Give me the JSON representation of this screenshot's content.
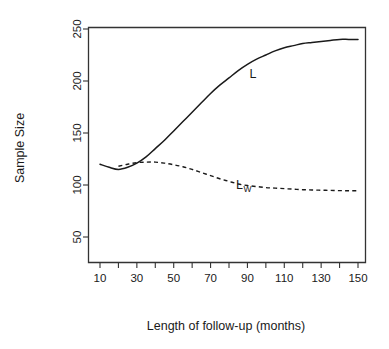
{
  "chart_data": {
    "type": "line",
    "title": "",
    "xlabel": "Length of follow-up (months)",
    "ylabel": "Sample Size",
    "xlim": [
      10,
      150
    ],
    "ylim": [
      40,
      258
    ],
    "grid": false,
    "legend_position": "inline-annotation",
    "x_ticks": [
      10,
      20,
      30,
      40,
      50,
      60,
      70,
      80,
      90,
      100,
      110,
      120,
      130,
      140,
      150
    ],
    "x_ticklabels": [
      "10",
      "",
      "30",
      "",
      "50",
      "",
      "70",
      "",
      "90",
      "",
      "110",
      "",
      "130",
      "",
      "150"
    ],
    "y_ticks": [
      50,
      100,
      150,
      200,
      250
    ],
    "y_ticklabels": [
      "50",
      "100",
      "150",
      "200",
      "250"
    ],
    "series": [
      {
        "name": "L",
        "style": "solid",
        "annotation": "L",
        "annotation_x": 93,
        "annotation_y": 203,
        "x": [
          10,
          15,
          20,
          25,
          30,
          35,
          40,
          45,
          50,
          55,
          60,
          65,
          70,
          75,
          80,
          85,
          90,
          95,
          100,
          105,
          110,
          115,
          120,
          125,
          130,
          135,
          140,
          145,
          150
        ],
        "values": [
          120,
          117,
          115,
          117,
          121,
          127,
          135,
          143,
          152,
          161,
          170,
          179,
          188,
          196,
          203,
          210,
          216,
          221,
          225,
          229,
          232,
          234,
          236,
          237,
          238,
          239,
          240,
          240,
          240
        ]
      },
      {
        "name": "Lw",
        "style": "dashed",
        "annotation": "L",
        "annotation_sub": "W",
        "annotation_x": 88,
        "annotation_y": 96,
        "x": [
          20,
          25,
          30,
          35,
          40,
          45,
          50,
          55,
          60,
          65,
          70,
          75,
          80,
          85,
          90,
          95,
          100,
          105,
          110,
          115,
          120,
          125,
          130,
          135,
          140,
          145,
          150
        ],
        "values": [
          118,
          120,
          121.5,
          122,
          122,
          121,
          119.5,
          117.5,
          115,
          112,
          109,
          106,
          103.5,
          101,
          99.5,
          98.5,
          97.5,
          97,
          96.5,
          96,
          95.5,
          95.2,
          95,
          94.8,
          94.6,
          94.5,
          94.5
        ]
      }
    ]
  },
  "colors": {
    "axis": "#333333",
    "curve": "#1a1a1a",
    "background": "#ffffff"
  }
}
